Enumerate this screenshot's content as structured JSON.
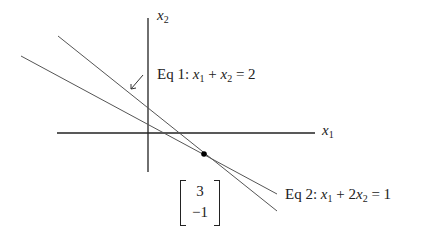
{
  "axes": {
    "x_label": "x",
    "x_sub": "1",
    "y_label": "x",
    "y_sub": "2"
  },
  "equations": [
    {
      "prefix": "Eq 1:",
      "text_parts": [
        "x",
        "1",
        " + ",
        "x",
        "2",
        " = 2"
      ],
      "label": "Eq 1: x1 + x2 = 2"
    },
    {
      "prefix": "Eq 2:",
      "text_parts": [
        "x",
        "1",
        " + 2",
        "x",
        "2",
        " = 1"
      ],
      "label": "Eq 2: x1 + 2x2 = 1"
    }
  ],
  "solution": {
    "top": "3",
    "bottom": "−1"
  },
  "colors": {
    "axis": "#222222",
    "line": "#555555",
    "point": "#000000"
  }
}
